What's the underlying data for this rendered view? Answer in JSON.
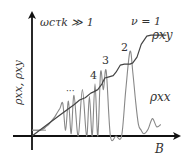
{
  "chart_data": {
    "type": "line",
    "title": "",
    "annotation": "ωcτk ≫ 1",
    "xlabel": "B",
    "ylabel": "ρxx, ρxy",
    "grid": false,
    "legend": "none",
    "xlim": [
      0,
      1
    ],
    "ylim": [
      0,
      1
    ],
    "series": [
      {
        "name": "ρxy",
        "label": "ρxy",
        "color": "#444444",
        "plateau_labels": [
          "ν = 1",
          "2",
          "3",
          "4",
          "···"
        ],
        "x": [
          0.0,
          0.1,
          0.2,
          0.3,
          0.34,
          0.38,
          0.42,
          0.44,
          0.47,
          0.5,
          0.52,
          0.55,
          0.58,
          0.6,
          0.63,
          0.66,
          0.7,
          0.72,
          0.75,
          0.78,
          0.82,
          0.85,
          0.88,
          0.92,
          0.96
        ],
        "y": [
          0.0,
          0.09,
          0.18,
          0.27,
          0.31,
          0.33,
          0.37,
          0.38,
          0.4,
          0.45,
          0.5,
          0.51,
          0.52,
          0.55,
          0.61,
          0.62,
          0.62,
          0.63,
          0.68,
          0.79,
          0.86,
          0.87,
          0.87,
          0.87,
          0.87
        ]
      },
      {
        "name": "ρxx",
        "label": "ρxx",
        "color": "#888888",
        "offset_line": 0.05,
        "x": [
          0.0,
          0.06,
          0.08,
          0.1,
          0.12,
          0.14,
          0.16,
          0.18,
          0.2,
          0.22,
          0.24,
          0.26,
          0.28,
          0.3,
          0.33,
          0.36,
          0.39,
          0.41,
          0.43,
          0.45,
          0.47,
          0.49,
          0.51,
          0.53,
          0.56,
          0.6,
          0.64,
          0.67,
          0.7,
          0.72,
          0.74,
          0.76,
          0.78,
          0.8,
          0.83,
          0.86,
          0.89,
          0.92
        ],
        "y": [
          0.05,
          0.05,
          0.06,
          0.08,
          0.1,
          0.13,
          0.16,
          0.2,
          0.24,
          0.28,
          0.05,
          0.3,
          0.02,
          0.35,
          0.0,
          0.4,
          0.0,
          0.34,
          0.0,
          0.45,
          0.0,
          0.55,
          0.4,
          0.56,
          0.0,
          0.0,
          0.0,
          0.4,
          0.73,
          0.55,
          0.3,
          0.1,
          0.05,
          0.02,
          0.06,
          0.15,
          0.08,
          0.1
        ]
      }
    ]
  }
}
